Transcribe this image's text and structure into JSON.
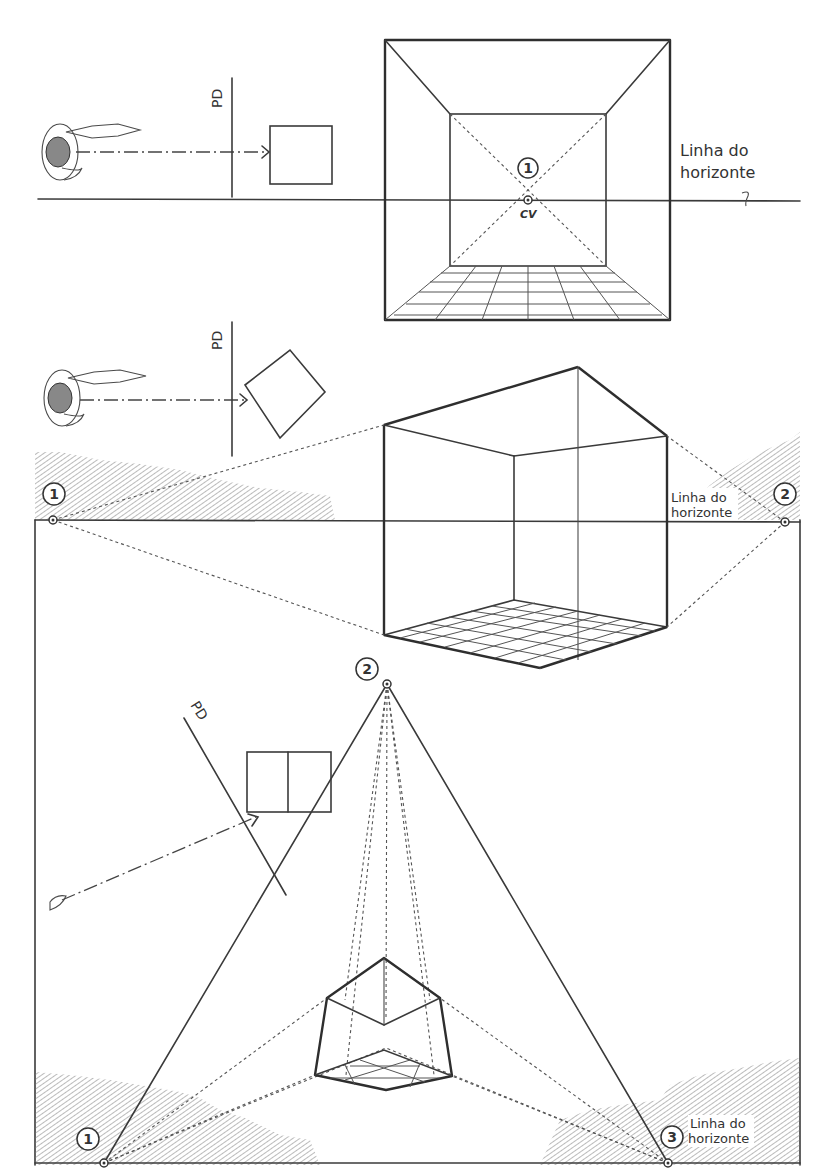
{
  "diagram": {
    "panel_one_point": {
      "plane_label": "PD",
      "vanishing_point_number": "1",
      "center_of_vision_label": "CV",
      "horizon_label_line1": "Linha do",
      "horizon_label_line2": "horizonte"
    },
    "panel_two_point": {
      "plane_label": "PD",
      "vp_left_number": "1",
      "vp_right_number": "2",
      "horizon_label_line1": "Linha do",
      "horizon_label_line2": "horizonte"
    },
    "panel_three_point": {
      "plane_label": "PD",
      "vp_top_number": "2",
      "vp_left_number": "1",
      "vp_right_number": "3",
      "horizon_label_line1": "Linha do",
      "horizon_label_line2": "horizonte"
    },
    "colors": {
      "ink": "#333333",
      "paper": "#ffffff"
    }
  }
}
